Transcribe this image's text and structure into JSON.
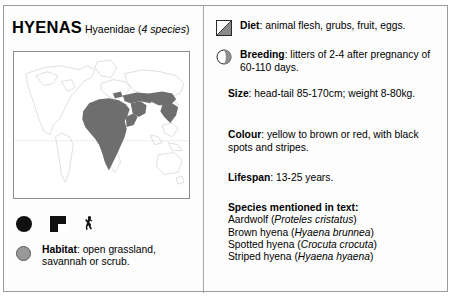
{
  "panel": {
    "title_main": "HYENAS",
    "title_sub_plain": "Hyaenidae (",
    "title_sub_italic": "4 species",
    "title_sub_close": ")"
  },
  "map": {
    "caption": "world distribution map",
    "range_region_label": "Africa, Arabia, Middle East and India",
    "shaded_color": "#6e6e6e",
    "outline_color": "#c9c9c9",
    "frame_color": "#8d8d8d"
  },
  "legend": {
    "icons": [
      {
        "name": "black-circle-symbol",
        "label": ""
      },
      {
        "name": "black-square-symbol",
        "label": ""
      },
      {
        "name": "animal-silhouette-symbol",
        "label": ""
      }
    ],
    "habitat": {
      "icon": "habitat-circle-icon",
      "label": "Habitat",
      "text": ": open grassland, savannah or scrub.",
      "full": "Habitat: open grassland, savannah or scrub."
    }
  },
  "facts": {
    "diet": {
      "icon": "diet-square-icon",
      "label": "Diet",
      "text": ": animal flesh, grubs, fruit, eggs."
    },
    "breeding": {
      "icon": "breeding-circle-icon",
      "label": "Breeding",
      "text": ": litters of 2-4 after pregnancy of 60-110 days."
    },
    "size": {
      "label": "Size",
      "text": ": head-tail 85-170cm; weight 8-80kg."
    },
    "colour": {
      "label": "Colour",
      "text": ": yellow to brown or red, with black spots and stripes."
    },
    "lifespan": {
      "label": "Lifespan",
      "text": ": 13-25 years."
    }
  },
  "species": {
    "heading": "Species mentioned in text:",
    "list": [
      {
        "common": "Aardwolf",
        "latin": "Proteles cristatus"
      },
      {
        "common": "Brown hyena",
        "latin": "Hyaena brunnea"
      },
      {
        "common": "Spotted hyena",
        "latin": "Crocuta crocuta"
      },
      {
        "common": "Striped hyena",
        "latin": "Hyaena hyaena"
      }
    ]
  },
  "colors": {
    "background": "#ffffff",
    "panel_border": "#9a9a9a",
    "text": "#000000",
    "habitat_dot": "#999999"
  }
}
